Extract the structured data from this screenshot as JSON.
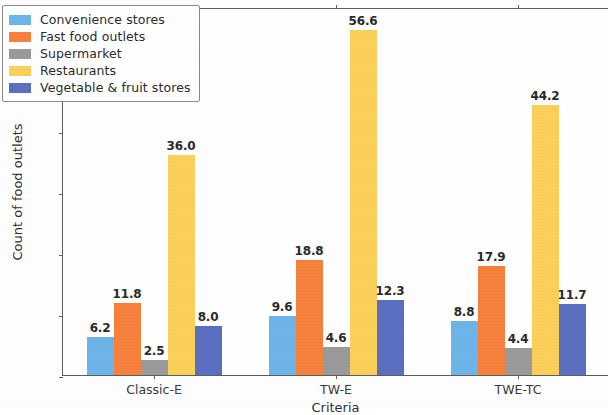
{
  "chart_data": {
    "type": "bar",
    "title": "",
    "xlabel": "Criteria",
    "ylabel": "Count of food outlets",
    "categories": [
      "Classic-E",
      "TW-E",
      "TWE-TC"
    ],
    "series": [
      {
        "name": "Convenience stores",
        "color": "#6eb4e8",
        "values": [
          6.2,
          9.6,
          8.8
        ]
      },
      {
        "name": "Fast food outlets",
        "color": "#f5813c",
        "values": [
          11.8,
          18.8,
          17.9
        ]
      },
      {
        "name": "Supermarket",
        "color": "#9a9a9a",
        "values": [
          2.5,
          4.6,
          4.4
        ]
      },
      {
        "name": "Restaurants",
        "color": "#fbd05a",
        "values": [
          36.0,
          56.6,
          44.2
        ]
      },
      {
        "name": "Vegetable & fruit stores",
        "color": "#5a6fc0",
        "values": [
          8.0,
          12.3,
          11.7
        ]
      }
    ],
    "value_labels": [
      [
        "6.2",
        "11.8",
        "2.5",
        "36.0",
        "8.0"
      ],
      [
        "9.6",
        "18.8",
        "4.6",
        "56.6",
        "12.3"
      ],
      [
        "8.8",
        "17.9",
        "4.4",
        "44.2",
        "11.7"
      ]
    ],
    "yticks": [
      0,
      10,
      20,
      30,
      40,
      50
    ],
    "ytick_labels": [
      "0",
      "10",
      "20",
      "30",
      "40",
      "50"
    ],
    "ylim": [
      0,
      60.3
    ],
    "grid": false,
    "legend_position": "upper left"
  }
}
